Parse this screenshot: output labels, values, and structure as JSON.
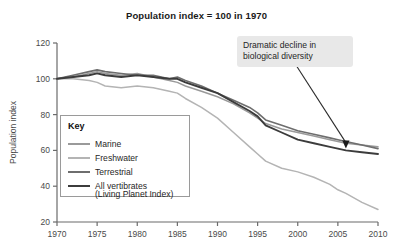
{
  "chart_data": {
    "type": "line",
    "title": "Population index = 100 in 1970",
    "xlabel": "",
    "ylabel": "Population index",
    "xlim": [
      1970,
      2010
    ],
    "ylim": [
      20,
      120
    ],
    "xticks": [
      "1970",
      "1975",
      "1980",
      "1985",
      "1990",
      "1995",
      "2000",
      "2005",
      "2010"
    ],
    "yticks": [
      "20",
      "40",
      "60",
      "80",
      "100",
      "120"
    ],
    "grid": false,
    "legend_position": "inside-lower-left",
    "legend_title": "Key",
    "x": [
      1970,
      1972,
      1974,
      1975,
      1976,
      1978,
      1980,
      1982,
      1984,
      1985,
      1986,
      1988,
      1990,
      1992,
      1994,
      1995,
      1996,
      1998,
      2000,
      2002,
      2004,
      2005,
      2006,
      2008,
      2010
    ],
    "series": [
      {
        "name": "Marine",
        "color": "#9a9a9a",
        "width": 1.5,
        "values": [
          100,
          101,
          103,
          104,
          103,
          102,
          103,
          101,
          99,
          98,
          96,
          93,
          90,
          86,
          81,
          78,
          75,
          72,
          70,
          68,
          66,
          65,
          64,
          63,
          62
        ]
      },
      {
        "name": "Freshwater",
        "color": "#b4b4b4",
        "width": 1.5,
        "values": [
          100,
          100,
          99,
          98,
          96,
          95,
          96,
          95,
          93,
          92,
          89,
          84,
          78,
          70,
          62,
          58,
          54,
          50,
          48,
          45,
          41,
          38,
          36,
          31,
          27
        ]
      },
      {
        "name": "Terrestrial",
        "color": "#6e6e6e",
        "width": 1.6,
        "values": [
          100,
          102,
          104,
          105,
          104,
          103,
          102,
          102,
          100,
          101,
          99,
          96,
          92,
          88,
          84,
          81,
          77,
          74,
          71,
          69,
          67,
          66,
          65,
          63,
          61
        ]
      },
      {
        "name": "All vertibrates",
        "subtitle": "(Living Planet Index)",
        "color": "#3c3c3c",
        "width": 1.9,
        "values": [
          100,
          101,
          102,
          103,
          102,
          101,
          102,
          101,
          100,
          100,
          98,
          95,
          92,
          87,
          82,
          79,
          74,
          70,
          66,
          64,
          62,
          61,
          60,
          59,
          58
        ]
      }
    ],
    "annotation": {
      "text_line1": "Dramatic decline in",
      "text_line2": "biological diversity",
      "arrow_target_year": 2006,
      "arrow_target_value": 61,
      "background": "#e8e8e8"
    }
  }
}
